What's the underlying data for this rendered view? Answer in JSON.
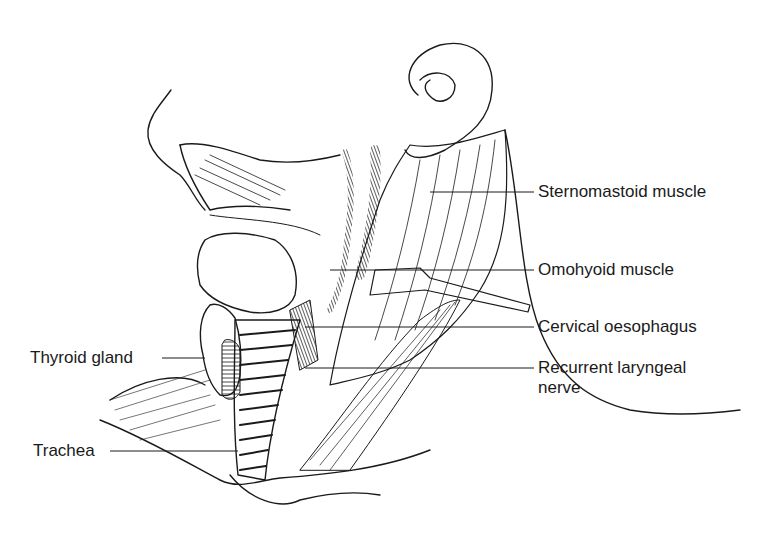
{
  "figure": {
    "labels": {
      "sternomastoid": "Sternomastoid muscle",
      "omohyoid": "Omohyoid muscle",
      "oesophagus": "Cervical oesophagus",
      "recurrent_nerve_line1": "Recurrent laryngeal",
      "recurrent_nerve_line2": "nerve",
      "thyroid": "Thyroid gland",
      "trachea": "Trachea"
    },
    "colors": {
      "ink": "#1a1a1a",
      "background": "#ffffff"
    }
  }
}
